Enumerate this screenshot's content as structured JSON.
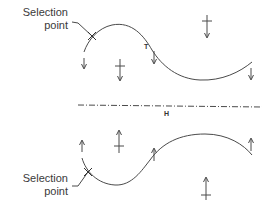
{
  "diagram": {
    "top": {
      "selection_label_line1": "Selection",
      "selection_label_line2": "point",
      "tangent_label": "T"
    },
    "axis": {
      "label": "H"
    },
    "bottom": {
      "selection_label_line1": "Selection",
      "selection_label_line2": "point"
    },
    "colors": {
      "stroke": "#4a4a4a",
      "text": "#3a3a3a",
      "background": "#ffffff"
    }
  }
}
